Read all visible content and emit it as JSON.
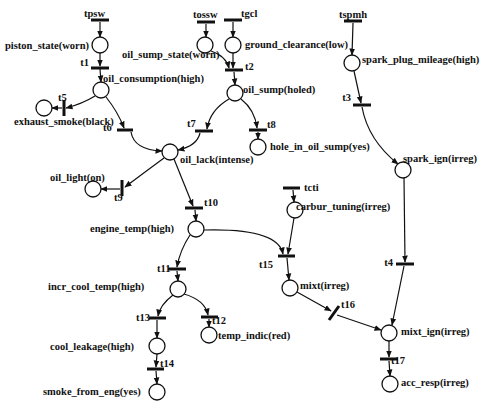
{
  "diagram": {
    "type": "petri-net",
    "places": {
      "piston_state": "piston_state(worn)",
      "oil_consumption": "oil_consumption(high)",
      "exhaust_smoke": "exhaust_smoke(black)",
      "oil_sump_state": "oil_sump_state(worn)",
      "ground_clearance": "ground_clearance(low)",
      "oil_sump": "oil_sump(holed)",
      "hole_in_oil_sump": "hole_in_oil_sump(yes)",
      "oil_lack": "oil_lack(intense)",
      "oil_light": "oil_light(on)",
      "engine_temp": "engine_temp(high)",
      "carbur_tuning": "carbur_tuning(irreg)",
      "spark_plug_mileage": "spark_plug_mileage(high)",
      "spark_ign": "spark_ign(irreg)",
      "incr_cool_temp": "incr_cool_temp(high)",
      "temp_indic": "temp_indic(red)",
      "cool_leakage": "cool_leakage(high)",
      "smoke_from_eng": "smoke_from_eng(yes)",
      "mixt": "mixt(irreg)",
      "mixt_ign": "mixt_ign(irreg)",
      "acc_resp": "acc_resp(irreg)"
    },
    "transitions": {
      "tpsw": "tpsw",
      "tossw": "tossw",
      "tgcl": "tgcl",
      "tspmh": "tspmh",
      "tcti": "tcti",
      "t1": "t1",
      "t2": "t2",
      "t3": "t3",
      "t4": "t4",
      "t5": "t5",
      "t6": "t6",
      "t7": "t7",
      "t8": "t8",
      "t9": "t9",
      "t10": "t10",
      "t11": "t11",
      "t12": "t12",
      "t13": "t13",
      "t14": "t14",
      "t15": "t15",
      "t16": "t16",
      "t17": "t17"
    }
  }
}
